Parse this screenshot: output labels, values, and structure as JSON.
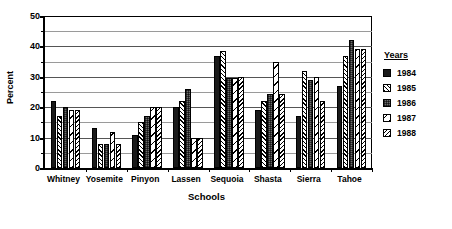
{
  "chart_data": {
    "type": "bar",
    "title": "",
    "xlabel": "Schools",
    "ylabel": "Percent",
    "ylim": [
      0,
      50
    ],
    "yticks": [
      0,
      10,
      20,
      30,
      40,
      50
    ],
    "yticks_minor": [
      5,
      15,
      25,
      35,
      45
    ],
    "grid": true,
    "legend_title": "Years",
    "legend_position": "right",
    "categories": [
      "Whitney",
      "Yosemite",
      "Pinyon",
      "Lassen",
      "Sequoia",
      "Shasta",
      "Sierra",
      "Tahoe"
    ],
    "series": [
      {
        "name": "1984",
        "pattern": "solid-black",
        "values": [
          22,
          13,
          11,
          20,
          37,
          19,
          17,
          27
        ]
      },
      {
        "name": "1985",
        "pattern": "forward-hatch",
        "values": [
          17,
          8,
          15,
          22,
          38.5,
          22,
          32,
          37
        ]
      },
      {
        "name": "1986",
        "pattern": "dotted-grey",
        "values": [
          20,
          8,
          17,
          26,
          29.5,
          24.5,
          29,
          42
        ]
      },
      {
        "name": "1987",
        "pattern": "light-back-ticks",
        "values": [
          19,
          12,
          20,
          10,
          29.5,
          35,
          30,
          39
        ]
      },
      {
        "name": "1988",
        "pattern": "back-hatch",
        "values": [
          19,
          8,
          20,
          10,
          30,
          24.5,
          22,
          39
        ]
      }
    ]
  },
  "legend": {
    "title": "Years",
    "items": [
      {
        "label": "1984"
      },
      {
        "label": "1985"
      },
      {
        "label": "1986"
      },
      {
        "label": "1987"
      },
      {
        "label": "1988"
      }
    ]
  },
  "axes": {
    "y_title": "Percent",
    "x_title": "Schools",
    "y_tick_labels": [
      "50",
      "40",
      "30",
      "20",
      "10",
      "0"
    ]
  }
}
